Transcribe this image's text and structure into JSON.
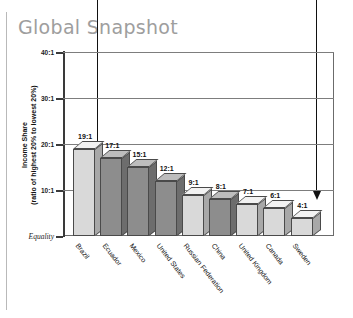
{
  "title": "Global Snapshot",
  "axis": {
    "y_caption_line1": "Income Share",
    "y_caption_line2": "(ratio of highest 20% to lowest 20%)",
    "ticks": [
      "40:1",
      "30:1",
      "20:1",
      "10:1",
      "Equality"
    ]
  },
  "chart_data": {
    "type": "bar",
    "title": "Global Snapshot",
    "xlabel": "",
    "ylabel": "Income Share (ratio of highest 20% to lowest 20%)",
    "ylim": [
      0,
      40
    ],
    "yticks": [
      40,
      30,
      20,
      10,
      0
    ],
    "ytick_labels": [
      "40:1",
      "30:1",
      "20:1",
      "10:1",
      "Equality"
    ],
    "grid": true,
    "legend": "none",
    "categories": [
      "Brazil",
      "Ecuador",
      "Mexico",
      "United States",
      "Russian Federation",
      "China",
      "United Kingdom",
      "Canada",
      "Sweden"
    ],
    "values": [
      19,
      17,
      15,
      12,
      9,
      8,
      7,
      6,
      4
    ],
    "data_labels": [
      "19:1",
      "17:1",
      "15:1",
      "12:1",
      "9:1",
      "8:1",
      "7:1",
      "6:1",
      "4:1"
    ],
    "bar_shades": [
      "light",
      "dark",
      "dark",
      "dark",
      "light",
      "dark",
      "light",
      "light",
      "light"
    ],
    "annotations": [
      {
        "name": "arrow-brazil",
        "target": "Brazil",
        "label": ""
      },
      {
        "name": "arrow-sweden",
        "target": "Sweden",
        "label": ""
      }
    ]
  },
  "colors": {
    "title": "#9e9e9e",
    "bar_light_front": "#d9d9d9",
    "bar_dark_front": "#8d8d8d",
    "bar_light_side": "#a8a8a8",
    "bar_dark_side": "#6d6d6d",
    "bar_light_top": "#f2f2f2",
    "bar_dark_top": "#bdbdbd",
    "axis": "#3a3a3a",
    "grid": "#7d7d7d"
  }
}
